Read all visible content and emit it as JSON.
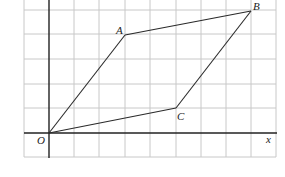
{
  "diagram": {
    "type": "coordinate-grid-parallelogram",
    "grid": {
      "cell_px": 25.2,
      "origin_px": [
        49,
        133
      ],
      "x_range_units": [
        -1,
        9
      ],
      "y_range_units": [
        -1,
        5.4
      ],
      "line_color": "#c8c8c8"
    },
    "axes": {
      "x_label": "x",
      "origin_label": "O",
      "color": "#222222"
    },
    "points": [
      {
        "name": "O",
        "label": "O",
        "x": 0,
        "y": 0
      },
      {
        "name": "A",
        "label": "A",
        "x": 3,
        "y": 4
      },
      {
        "name": "B",
        "label": "B",
        "x": 8,
        "y": 5
      },
      {
        "name": "C",
        "label": "C",
        "x": 5,
        "y": 1
      }
    ],
    "edges": [
      [
        "O",
        "A"
      ],
      [
        "A",
        "B"
      ],
      [
        "B",
        "C"
      ],
      [
        "C",
        "O"
      ]
    ],
    "labels": {
      "A": "A",
      "B": "B",
      "C": "C",
      "O": "O",
      "x": "x"
    }
  }
}
